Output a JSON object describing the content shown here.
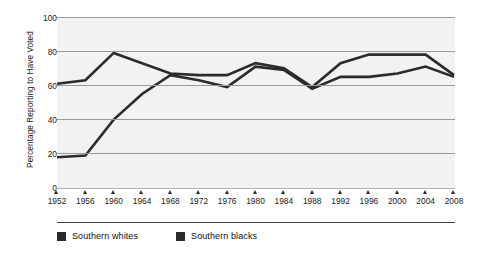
{
  "chart_data": {
    "type": "line",
    "title": "",
    "subtitle": "",
    "xlabel": "",
    "ylabel": "Percentage Reporting to Have Voted",
    "x": [
      1952,
      1956,
      1960,
      1964,
      1968,
      1972,
      1976,
      1980,
      1984,
      1988,
      1992,
      1996,
      2000,
      2004,
      2008
    ],
    "categories": [
      "1952",
      "1956",
      "1960",
      "1964",
      "1968",
      "1972",
      "1976",
      "1980",
      "1984",
      "1988",
      "1992",
      "1996",
      "2000",
      "2004",
      "2008"
    ],
    "series": [
      {
        "name": "Southern whites",
        "color": "#2b2b2b",
        "values": [
          61,
          63,
          79,
          73,
          67,
          66,
          66,
          73,
          70,
          59,
          73,
          78,
          78,
          78,
          66
        ]
      },
      {
        "name": "Southern blacks",
        "color": "#2b2b2b",
        "values": [
          18,
          19,
          40,
          55,
          66,
          63,
          59,
          71,
          69,
          58,
          65,
          65,
          67,
          71,
          65
        ]
      }
    ],
    "xlim": [
      1952,
      2008
    ],
    "ylim": [
      0,
      100
    ],
    "yticks": [
      0,
      20,
      40,
      60,
      80,
      100
    ],
    "ytick_labels": [
      "0",
      "20",
      "40",
      "60",
      "80",
      "100"
    ],
    "grid": true,
    "grid_axis": "y",
    "legend_position": "bottom-left",
    "plot_background": "#f2f2f2",
    "gridline_color": "#9a9a9a"
  },
  "legend": {
    "items": [
      {
        "label": "Southern whites",
        "color": "#2b2b2b"
      },
      {
        "label": "Southern blacks",
        "color": "#2b2b2b"
      }
    ]
  }
}
